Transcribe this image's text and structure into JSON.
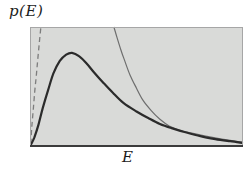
{
  "chart_data": {
    "type": "line",
    "title": "",
    "xlabel": "E",
    "ylabel": "p(E)",
    "x_ticks": [],
    "y_ticks": [],
    "grid": false,
    "legend": "none",
    "xlim_normalized": [
      0,
      1
    ],
    "ylim_normalized": [
      0,
      1
    ],
    "layout": {
      "background": "#ffffff",
      "plot_fill": "#d9dad8",
      "border_color": "#a6a6a6",
      "axis_color": "#3b3b3b",
      "plot_rect": {
        "left": 30,
        "top": 27,
        "width": 213,
        "height": 119
      }
    },
    "series": [
      {
        "id": "dashed-rising-curve",
        "line_style": "dashed",
        "stroke": "#7d7d7d",
        "stroke_width": 1.3,
        "dash": "5 3.5",
        "points": [
          [
            0.004,
            0.02
          ],
          [
            0.008,
            0.15
          ],
          [
            0.015,
            0.3
          ],
          [
            0.022,
            0.455
          ],
          [
            0.03,
            0.6
          ],
          [
            0.037,
            0.74
          ],
          [
            0.044,
            0.875
          ],
          [
            0.051,
            1.0
          ]
        ]
      },
      {
        "id": "thin-falling-curve",
        "line_style": "solid",
        "stroke": "#6e6e6e",
        "stroke_width": 1.2,
        "dash": "",
        "points": [
          [
            0.394,
            1.0
          ],
          [
            0.408,
            0.915
          ],
          [
            0.427,
            0.805
          ],
          [
            0.447,
            0.705
          ],
          [
            0.47,
            0.595
          ],
          [
            0.5,
            0.485
          ],
          [
            0.53,
            0.385
          ],
          [
            0.568,
            0.3
          ],
          [
            0.61,
            0.225
          ],
          [
            0.657,
            0.165
          ],
          [
            0.705,
            0.13
          ],
          [
            0.76,
            0.108
          ],
          [
            0.825,
            0.082
          ],
          [
            0.9,
            0.058
          ],
          [
            1.0,
            0.032
          ]
        ]
      },
      {
        "id": "p-of-E-thick-curve",
        "line_style": "solid",
        "stroke": "#2b2b2b",
        "stroke_width": 2.2,
        "dash": "",
        "points": [
          [
            0.004,
            0.01
          ],
          [
            0.02,
            0.07
          ],
          [
            0.04,
            0.18
          ],
          [
            0.06,
            0.32
          ],
          [
            0.085,
            0.47
          ],
          [
            0.11,
            0.61
          ],
          [
            0.14,
            0.715
          ],
          [
            0.17,
            0.767
          ],
          [
            0.197,
            0.782
          ],
          [
            0.23,
            0.755
          ],
          [
            0.265,
            0.695
          ],
          [
            0.3,
            0.62
          ],
          [
            0.345,
            0.53
          ],
          [
            0.39,
            0.445
          ],
          [
            0.44,
            0.36
          ],
          [
            0.5,
            0.29
          ],
          [
            0.555,
            0.235
          ],
          [
            0.61,
            0.185
          ],
          [
            0.665,
            0.15
          ],
          [
            0.73,
            0.115
          ],
          [
            0.8,
            0.083
          ],
          [
            0.87,
            0.058
          ],
          [
            0.94,
            0.04
          ],
          [
            1.0,
            0.025
          ]
        ]
      }
    ]
  }
}
